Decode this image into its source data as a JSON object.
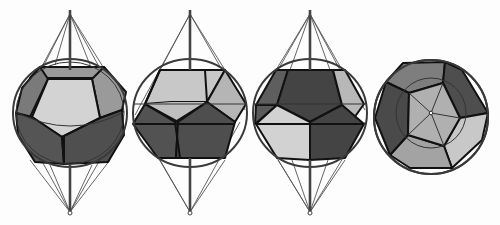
{
  "figure": {
    "title": "",
    "colors": {
      "background": "#fdfdfd",
      "face_light": "#d4d4d4",
      "face_mid_light": "#b0b0b0",
      "face_mid": "#8a8a8a",
      "face_dark": "#5a5a5a",
      "face_darker": "#454545",
      "edge": "#111111",
      "sphere": "#3a3a3a",
      "axis": "#444444"
    },
    "views": [
      {
        "id": "view-1",
        "label": "",
        "orientation": "face-on, tilted"
      },
      {
        "id": "view-2",
        "label": "",
        "orientation": "edge-on, upright"
      },
      {
        "id": "view-3",
        "label": "",
        "orientation": "edge-on, rotated"
      },
      {
        "id": "view-4",
        "label": "",
        "orientation": "top view along axis"
      }
    ]
  }
}
